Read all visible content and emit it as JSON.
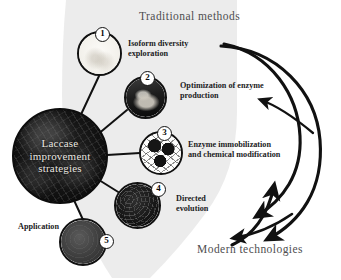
{
  "diagram": {
    "headers": {
      "traditional": "Traditional methods",
      "modern": "Modern technologies"
    },
    "hub": {
      "label": "Laccase\nimprovement\nstrategies"
    },
    "nodes": [
      {
        "number": "1",
        "label": "Isoform diversity\nexploration"
      },
      {
        "number": "2",
        "label": "Optimization of enzyme\nproduction"
      },
      {
        "number": "3",
        "label": "Enzyme immobilization\nand chemical modification"
      },
      {
        "number": "4",
        "label": "Directed\nevolution"
      },
      {
        "number": "5",
        "label": "Application"
      }
    ],
    "colors": {
      "ink": "#111111",
      "backdrop": "#ebebeb",
      "header_text": "#4e4e50",
      "label_text": "#1b1b1d",
      "hub_text": "#e9e6e0"
    }
  }
}
